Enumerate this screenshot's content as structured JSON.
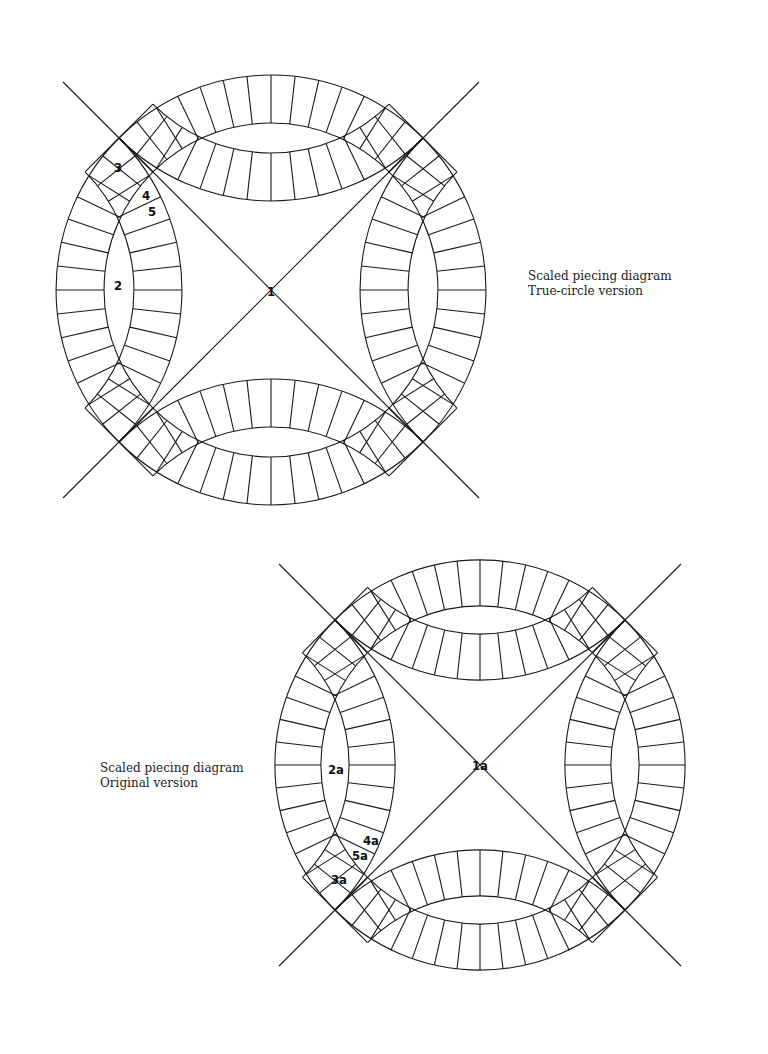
{
  "captions": {
    "true_circle": {
      "line1": "Scaled piecing diagram",
      "line2": "True-circle version"
    },
    "original": {
      "line1": "Scaled piecing diagram",
      "line2": "Original version"
    }
  },
  "diagrams": [
    {
      "id": "true-circle",
      "title": "Scaled piecing diagram - True-circle version",
      "center": [
        271,
        290
      ],
      "half_span": 152,
      "outer_radius": 215,
      "band_width": 48,
      "segments_per_arc": 14,
      "labels": [
        {
          "text": "1",
          "x": 271,
          "y": 296,
          "piece": "center square"
        },
        {
          "text": "2",
          "x": 118,
          "y": 290,
          "piece": "melon"
        },
        {
          "text": "3",
          "x": 118,
          "y": 172,
          "piece": "corner square"
        },
        {
          "text": "4",
          "x": 146,
          "y": 200,
          "piece": "arc wedge"
        },
        {
          "text": "5",
          "x": 152,
          "y": 216,
          "piece": "arc wedge"
        }
      ]
    },
    {
      "id": "original",
      "title": "Scaled piecing diagram - Original version",
      "center": [
        480,
        765
      ],
      "half_span": 145,
      "outer_radius": 205,
      "band_width": 46,
      "segments_per_arc": 14,
      "labels": [
        {
          "text": "1a",
          "x": 480,
          "y": 770,
          "piece": "center square"
        },
        {
          "text": "2a",
          "x": 336,
          "y": 774,
          "piece": "melon"
        },
        {
          "text": "3a",
          "x": 339,
          "y": 884,
          "piece": "corner square"
        },
        {
          "text": "4a",
          "x": 371,
          "y": 845,
          "piece": "arc wedge"
        },
        {
          "text": "5a",
          "x": 360,
          "y": 860,
          "piece": "arc wedge"
        }
      ]
    }
  ],
  "colors": {
    "line": "#1a1a1a",
    "background": "#ffffff"
  }
}
